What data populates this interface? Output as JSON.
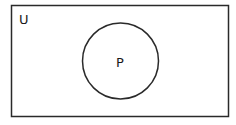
{
  "diagram": {
    "type": "venn",
    "universal_set": {
      "label": "U"
    },
    "sets": [
      {
        "label": "P"
      }
    ],
    "colors": {
      "stroke": "#2a2a2a",
      "background": "#ffffff"
    }
  }
}
